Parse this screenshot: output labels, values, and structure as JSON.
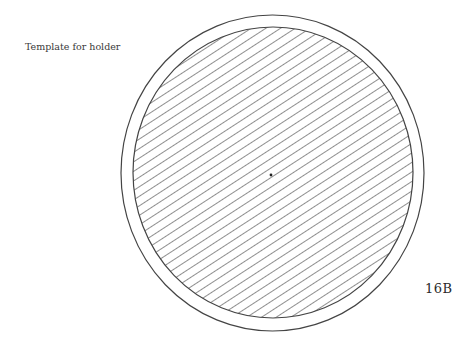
{
  "caption": "Template for holder",
  "figure_label": "16B",
  "figure": {
    "outer_ring": {
      "cx": 272.5,
      "cy": 173,
      "rx": 151.5,
      "ry": 158
    },
    "inner_disc": {
      "cx": 273,
      "cy": 172.5,
      "rx": 140,
      "ry": 145.5
    },
    "center_mark": {
      "cx": 271,
      "cy": 175
    },
    "hatch": {
      "angle_deg": -33,
      "spacing_px": 8,
      "color": "#333333"
    },
    "stroke_color": "#444444"
  }
}
